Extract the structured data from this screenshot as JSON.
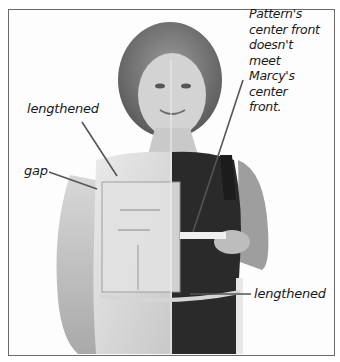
{
  "figure": {
    "annotations": {
      "top_right": [
        "Pattern's",
        "center front",
        "doesn't",
        "meet",
        "Marcy's",
        "center",
        "front."
      ],
      "upper_left": "lengthened",
      "left": "gap",
      "bottom_right": "lengthened"
    }
  },
  "colors": {
    "frame_border": "#6a6a6a",
    "label_text": "#1a1a1a",
    "leader_line": "#555555"
  }
}
